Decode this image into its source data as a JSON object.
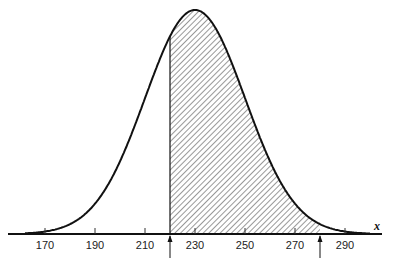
{
  "chart_data": {
    "type": "area",
    "title": "",
    "xlabel": "x",
    "ylabel": "",
    "distribution": {
      "mean": 230,
      "sd": 20
    },
    "x_ticks": [
      170,
      190,
      210,
      230,
      250,
      270,
      290
    ],
    "x_tick_labels": [
      "170",
      "190",
      "210",
      "230",
      "250",
      "270",
      "290"
    ],
    "xlim": [
      155,
      310
    ],
    "shaded_region": {
      "from": 220,
      "to": 280,
      "pattern": "diagonal-hatch"
    },
    "markers": [
      {
        "x": 220,
        "type": "arrow-up"
      },
      {
        "x": 280,
        "type": "arrow-up"
      }
    ],
    "grid": false,
    "legend": null
  },
  "axis": {
    "variable_label": "x"
  }
}
